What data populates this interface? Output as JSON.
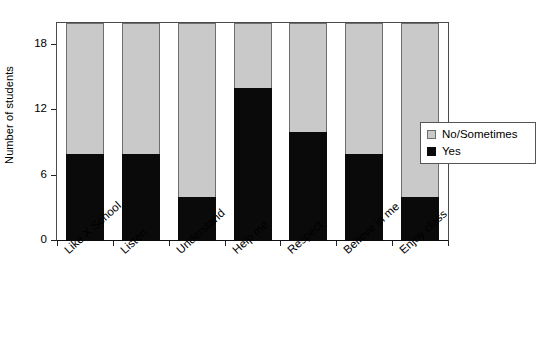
{
  "chart_data": {
    "type": "bar",
    "subtype": "stacked-vertical",
    "title": "",
    "xlabel": "",
    "ylabel": "Number of students",
    "categories": [
      "Like X School",
      "Listen",
      "Understand",
      "Help me",
      "Respect",
      "Believe in me",
      "Enjoy class"
    ],
    "series": [
      {
        "name": "Yes",
        "color": "#0a0a0a",
        "values": [
          8,
          8,
          4,
          14,
          10,
          8,
          4
        ]
      },
      {
        "name": "No/Sometimes",
        "color": "#c9c9c9",
        "values": [
          12,
          12,
          16,
          6,
          10,
          12,
          16
        ]
      }
    ],
    "totals": [
      20,
      20,
      20,
      20,
      20,
      20,
      20
    ],
    "ylim": [
      0,
      20
    ],
    "yticks": [
      0,
      6,
      12,
      18
    ],
    "ytick_labels": [
      "0",
      "6",
      "12",
      "18"
    ],
    "grid": false,
    "legend_position": "right",
    "legend_entries": [
      {
        "label": "No/Sometimes",
        "swatch": "gray"
      },
      {
        "label": "Yes",
        "swatch": "black"
      }
    ]
  },
  "axis": {
    "y_title": "Number of students"
  }
}
